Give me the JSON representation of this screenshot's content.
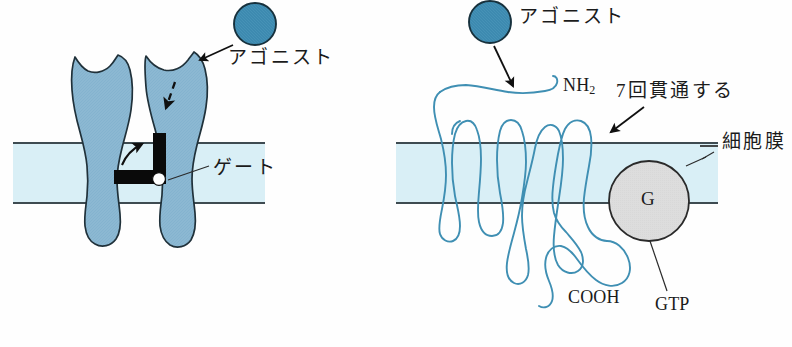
{
  "figure": {
    "kind": "biology-diagram",
    "background_color": "#fefefe",
    "panels": [
      {
        "name": "ionotropic-receptor",
        "labels": {
          "agonist": "アゴニスト",
          "gate": "ゲート"
        }
      },
      {
        "name": "g-protein-coupled-receptor",
        "labels": {
          "agonist": "アゴニスト",
          "n_terminus": "NH",
          "n_terminus_subscript": "2",
          "seven_pass": "7回貫通する",
          "cell_membrane": "細胞膜",
          "c_terminus": "COOH",
          "gtp": "GTP",
          "g_protein": "G"
        }
      }
    ],
    "colors": {
      "agonist_fill": "#3d8ab0",
      "agonist_stroke": "#17313d",
      "protein_fill": "#8cb8d2",
      "protein_stroke": "#20313a",
      "membrane_fill": "#d8eef5",
      "membrane_line": "#3d4a50",
      "chain_stroke": "#3f8fb3",
      "g_fill": "#dcdcdc",
      "g_stroke": "#2a2a2a",
      "gate_fill": "#0a0a0a",
      "text": "#1b1b1b"
    }
  }
}
